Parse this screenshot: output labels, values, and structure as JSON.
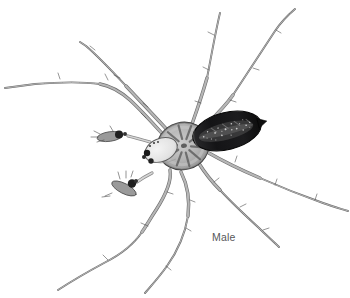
{
  "figure": {
    "label": "Male",
    "label_color": "#57575a",
    "background_color": "#ffffff",
    "colors": {
      "leg": "#b6b6b6",
      "leg_outline": "#6e6e6e",
      "carapace": "#b3b3b3",
      "carapace_streaks": "#555555",
      "head": "#ececec",
      "abdomen": "#18181a",
      "abdomen_speckles": "#e9e9e9",
      "palp_bulb": "#1f1f1f"
    }
  }
}
